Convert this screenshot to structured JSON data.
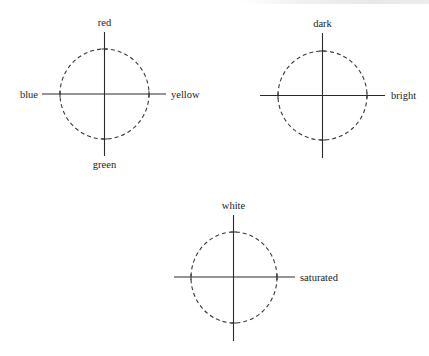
{
  "figure": {
    "diagrams": [
      {
        "id": "hue",
        "center": [
          104.5,
          94
        ],
        "radius": [
          44.5,
          45
        ],
        "v_axis": [
          32,
          156
        ],
        "h_axis": [
          42,
          166
        ],
        "labels": {
          "top": "red",
          "bottom": "green",
          "left": "blue",
          "right": "yellow"
        }
      },
      {
        "id": "brightness",
        "center": [
          322.5,
          95.5
        ],
        "radius": [
          44.5,
          44.5
        ],
        "v_axis": [
          33,
          158
        ],
        "h_axis": [
          260,
          385
        ],
        "labels": {
          "top": "dark",
          "right": "bright"
        }
      },
      {
        "id": "saturation",
        "center": [
          234,
          277.5
        ],
        "radius": [
          43,
          45.5
        ],
        "v_axis": [
          215,
          341
        ],
        "h_axis": [
          174,
          295
        ],
        "labels": {
          "top": "white",
          "right": "saturated"
        }
      }
    ],
    "colors": {
      "line": "#2a2a2a",
      "dashed_circle": "#3a3a3a",
      "text": "#222222",
      "background": "#ffffff"
    }
  }
}
